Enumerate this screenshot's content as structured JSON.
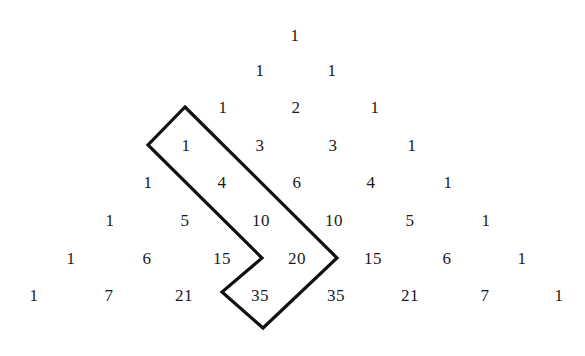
{
  "figure": {
    "type": "pascal-triangle-diagram",
    "background_color": "#ffffff",
    "text_color": "#1a1a1a",
    "outline_color": "#111111",
    "outline_width": 3.2,
    "width": 585,
    "height": 356
  },
  "chart_data": {
    "type": "table",
    "title": "",
    "rows": [
      [
        1
      ],
      [
        1,
        1
      ],
      [
        1,
        2,
        1
      ],
      [
        1,
        3,
        3,
        1
      ],
      [
        1,
        4,
        6,
        4,
        1
      ],
      [
        1,
        5,
        10,
        10,
        5,
        1
      ],
      [
        1,
        6,
        15,
        20,
        15,
        6,
        1
      ],
      [
        1,
        7,
        21,
        35,
        35,
        21,
        7,
        1
      ]
    ]
  },
  "cells": [
    {
      "label": "1",
      "row": 0,
      "col": 0,
      "x": 295,
      "y": 35
    },
    {
      "label": "1",
      "row": 1,
      "col": 0,
      "x": 260,
      "y": 70
    },
    {
      "label": "1",
      "row": 1,
      "col": 1,
      "x": 332,
      "y": 70
    },
    {
      "label": "1",
      "row": 2,
      "col": 0,
      "x": 223,
      "y": 107
    },
    {
      "label": "2",
      "row": 2,
      "col": 1,
      "x": 296,
      "y": 107
    },
    {
      "label": "1",
      "row": 2,
      "col": 2,
      "x": 375,
      "y": 107
    },
    {
      "label": "1",
      "row": 3,
      "col": 0,
      "x": 186,
      "y": 145
    },
    {
      "label": "3",
      "row": 3,
      "col": 1,
      "x": 260,
      "y": 145
    },
    {
      "label": "3",
      "row": 3,
      "col": 2,
      "x": 333,
      "y": 145
    },
    {
      "label": "1",
      "row": 3,
      "col": 3,
      "x": 412,
      "y": 145
    },
    {
      "label": "1",
      "row": 4,
      "col": 0,
      "x": 148,
      "y": 182
    },
    {
      "label": "4",
      "row": 4,
      "col": 1,
      "x": 222,
      "y": 182
    },
    {
      "label": "6",
      "row": 4,
      "col": 2,
      "x": 297,
      "y": 182
    },
    {
      "label": "4",
      "row": 4,
      "col": 3,
      "x": 371,
      "y": 182
    },
    {
      "label": "1",
      "row": 4,
      "col": 4,
      "x": 448,
      "y": 182
    },
    {
      "label": "1",
      "row": 5,
      "col": 0,
      "x": 110,
      "y": 220
    },
    {
      "label": "5",
      "row": 5,
      "col": 1,
      "x": 185,
      "y": 220
    },
    {
      "label": "10",
      "row": 5,
      "col": 2,
      "x": 261,
      "y": 220
    },
    {
      "label": "10",
      "row": 5,
      "col": 3,
      "x": 334,
      "y": 220
    },
    {
      "label": "5",
      "row": 5,
      "col": 4,
      "x": 410,
      "y": 220
    },
    {
      "label": "1",
      "row": 5,
      "col": 5,
      "x": 486,
      "y": 220
    },
    {
      "label": "1",
      "row": 6,
      "col": 0,
      "x": 71,
      "y": 258
    },
    {
      "label": "6",
      "row": 6,
      "col": 1,
      "x": 147,
      "y": 258
    },
    {
      "label": "15",
      "row": 6,
      "col": 2,
      "x": 222,
      "y": 258
    },
    {
      "label": "20",
      "row": 6,
      "col": 3,
      "x": 297,
      "y": 258
    },
    {
      "label": "15",
      "row": 6,
      "col": 4,
      "x": 373,
      "y": 258
    },
    {
      "label": "6",
      "row": 6,
      "col": 5,
      "x": 447,
      "y": 258
    },
    {
      "label": "1",
      "row": 6,
      "col": 6,
      "x": 522,
      "y": 258
    },
    {
      "label": "1",
      "row": 7,
      "col": 0,
      "x": 34,
      "y": 295
    },
    {
      "label": "7",
      "row": 7,
      "col": 1,
      "x": 109,
      "y": 295
    },
    {
      "label": "21",
      "row": 7,
      "col": 2,
      "x": 184,
      "y": 295
    },
    {
      "label": "35",
      "row": 7,
      "col": 3,
      "x": 260,
      "y": 295
    },
    {
      "label": "35",
      "row": 7,
      "col": 4,
      "x": 336,
      "y": 295
    },
    {
      "label": "21",
      "row": 7,
      "col": 5,
      "x": 410,
      "y": 295
    },
    {
      "label": "7",
      "row": 7,
      "col": 6,
      "x": 485,
      "y": 295
    },
    {
      "label": "1",
      "row": 7,
      "col": 7,
      "x": 559,
      "y": 295
    }
  ],
  "outline": {
    "name": "hockey-stick-region-outline",
    "closed": true,
    "points": "185,107 337,258 263,328 222,292 262,258 148,145"
  }
}
